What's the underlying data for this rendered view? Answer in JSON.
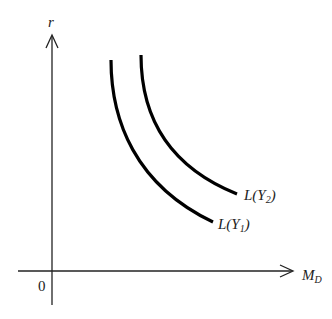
{
  "diagram": {
    "type": "economics-money-demand",
    "axes": {
      "y_label": "r",
      "x_label_main": "M",
      "x_label_sub": "D",
      "origin_label": "0"
    },
    "curves": [
      {
        "name": "L(Y1)",
        "label_prefix": "L(",
        "label_var": "Y",
        "label_sub": "1",
        "label_suffix": ")"
      },
      {
        "name": "L(Y2)",
        "label_prefix": "L(",
        "label_var": "Y",
        "label_sub": "2",
        "label_suffix": ")"
      }
    ],
    "colors": {
      "axis": "#222222",
      "curve": "#000000",
      "background": "#ffffff"
    }
  }
}
